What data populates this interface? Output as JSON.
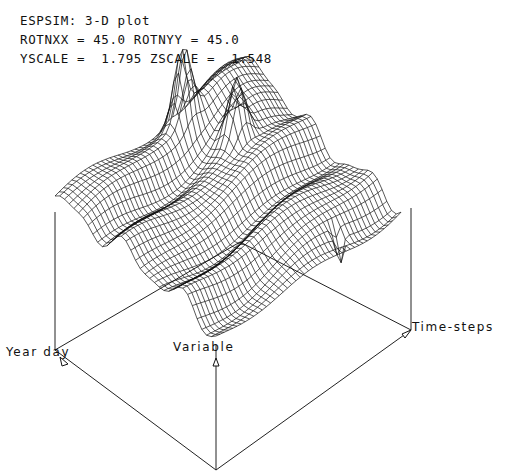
{
  "header": {
    "title": "ESPSIM: 3-D plot",
    "rotation": "ROTNXX = 45.0 ROTNYY = 45.0",
    "scale": "YSCALE =  1.795 ZSCALE =  1.548"
  },
  "chart_data": {
    "type": "surface-wireframe",
    "title": "ESPSIM: 3-D plot",
    "params": {
      "ROTNXX": 45.0,
      "ROTNYY": 45.0,
      "YSCALE": 1.795,
      "ZSCALE": 1.548
    },
    "axes": {
      "x_label": "Year day",
      "y_label": "Variable",
      "z_label": "Time-steps"
    },
    "grid": false,
    "legend": null,
    "features": [
      "two tall peaks near the back-center of the surface",
      "ridged undulating surface along Year day direction",
      "sharp downward spike near the right front edge"
    ]
  },
  "axes_labels": {
    "year_day": "Year day",
    "variable": "Variable",
    "time_steps": "Time-steps"
  }
}
